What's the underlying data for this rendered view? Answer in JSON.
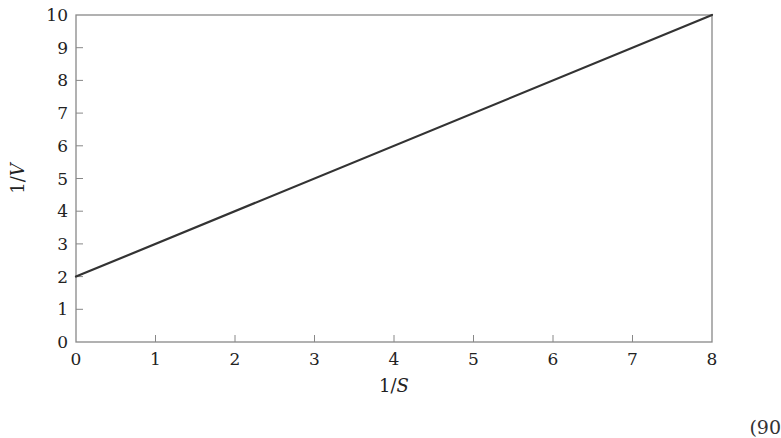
{
  "chart_data": {
    "type": "line",
    "title": "",
    "xlabel": "1/S",
    "ylabel": "1/V",
    "xlim": [
      0,
      8
    ],
    "ylim": [
      0,
      10
    ],
    "xticks": [
      0,
      1,
      2,
      3,
      4,
      5,
      6,
      7,
      8
    ],
    "yticks": [
      0,
      1,
      2,
      3,
      4,
      5,
      6,
      7,
      8,
      9,
      10
    ],
    "grid": false,
    "legend": null,
    "series": [
      {
        "name": "line",
        "x": [
          0,
          8
        ],
        "y": [
          2,
          10
        ],
        "color": "#333333"
      }
    ],
    "frame_color": "#888888"
  },
  "footer": {
    "partial_text": "(90"
  }
}
